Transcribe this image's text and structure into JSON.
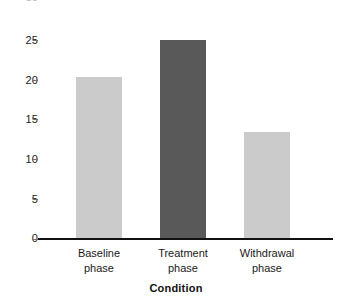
{
  "chart_data": {
    "type": "bar",
    "title": "",
    "subtitle": "",
    "xlabel": "Condition",
    "ylabel": "",
    "categories": [
      "Baseline phase",
      "Treatment phase",
      "Withdrawal phase"
    ],
    "category_lines": [
      [
        "Baseline",
        "phase"
      ],
      [
        "Treatment",
        "phase"
      ],
      [
        "Withdrawal",
        "phase"
      ]
    ],
    "values": [
      20.3,
      25.0,
      13.5
    ],
    "bar_colors": [
      "#cbcbcb",
      "#595959",
      "#cbcbcb"
    ],
    "ylim": [
      0,
      30
    ],
    "yticks": [
      0,
      5,
      10,
      15,
      20,
      25
    ],
    "ytick_labels": [
      "0",
      "5",
      "10",
      "15",
      "20",
      "25"
    ],
    "ytick_cropped_top": "30",
    "grid": false,
    "legend": "none",
    "axis_color": "#111111",
    "background": "#ffffff"
  },
  "axis": {
    "y_ticks": [
      {
        "label": "25",
        "value": 25
      },
      {
        "label": "20",
        "value": 20
      },
      {
        "label": "15",
        "value": 15
      },
      {
        "label": "10",
        "value": 10
      },
      {
        "label": "5",
        "value": 5
      },
      {
        "label": "0",
        "value": 0
      }
    ],
    "x_title": "Condition"
  },
  "bars": [
    {
      "name": "baseline-phase",
      "line1": "Baseline",
      "line2": "phase",
      "value": 20.3,
      "color": "#cbcbcb"
    },
    {
      "name": "treatment-phase",
      "line1": "Treatment",
      "line2": "phase",
      "value": 25.0,
      "color": "#595959"
    },
    {
      "name": "withdrawal-phase",
      "line1": "Withdrawal",
      "line2": "phase",
      "value": 13.5,
      "color": "#cbcbcb"
    }
  ],
  "cropped_label": {
    "text": "30"
  }
}
